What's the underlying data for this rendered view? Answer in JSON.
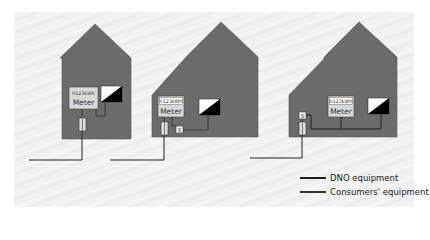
{
  "diagram": {
    "houses": [
      {
        "id": 1,
        "meter_reading": "0123kWh",
        "meter_label": "Meter",
        "switch_label": null
      },
      {
        "id": 2,
        "meter_reading": "0123kWh",
        "meter_label": "Meter",
        "switch_label": "S"
      },
      {
        "id": 3,
        "meter_reading": "0123kWh",
        "meter_label": "Meter",
        "switch_label": "S"
      }
    ],
    "legend": [
      {
        "label": "DNO equipment",
        "color": "#1e1e1e"
      },
      {
        "label": "Consumers' equipment",
        "color": "#333333"
      }
    ],
    "colors": {
      "house": "#6b6b6b",
      "background": "#f2f2f2",
      "meter": "#d8d8d8",
      "line": "#222222"
    }
  }
}
